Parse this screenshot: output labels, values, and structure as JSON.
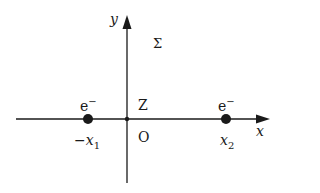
{
  "diagram": {
    "axes": {
      "x_label": "x",
      "y_label": "y"
    },
    "region_label": "Σ",
    "origin": {
      "label": "O",
      "nucleus_label": "Z"
    },
    "particles": [
      {
        "label": "e",
        "charge": "−",
        "position_label": "−x",
        "subscript": "1"
      },
      {
        "label": "e",
        "charge": "−",
        "position_label": "x",
        "subscript": "2"
      }
    ],
    "colors": {
      "ink": "#1a1a1a",
      "background": "#ffffff"
    }
  }
}
